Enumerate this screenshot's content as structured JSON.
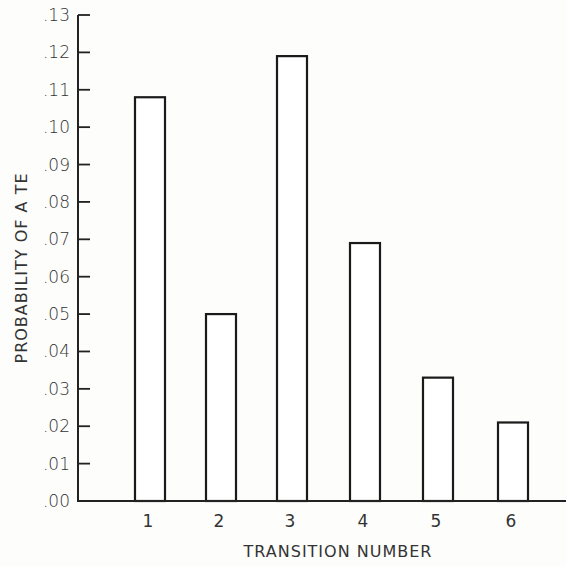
{
  "chart_data": {
    "type": "bar",
    "title": "",
    "xlabel": "TRANSITION NUMBER",
    "ylabel": "PROBABILITY OF A TE",
    "categories": [
      "1",
      "2",
      "3",
      "4",
      "5",
      "6"
    ],
    "values": [
      0.108,
      0.05,
      0.119,
      0.069,
      0.033,
      0.021
    ],
    "ylim": [
      0.0,
      0.13
    ],
    "yticks": [
      ".00",
      ".01",
      ".02",
      ".03",
      ".04",
      ".05",
      ".06",
      ".07",
      ".08",
      ".09",
      ".10",
      ".11",
      ".12",
      ".13"
    ],
    "grid": false,
    "legend": null,
    "bar_fill": "#ffffff",
    "bar_stroke": "#1a1a1a"
  }
}
